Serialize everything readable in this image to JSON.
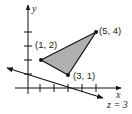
{
  "diagram": {
    "axes": {
      "x_label": "x",
      "y_label": "y",
      "x_ticks": [
        1,
        2,
        3,
        4,
        5
      ],
      "y_ticks": [
        1,
        2,
        3,
        4
      ]
    },
    "triangle": {
      "fill": "#b0b0b0",
      "stroke": "#111111",
      "vertices": [
        {
          "label": "(1, 2)",
          "x": 1,
          "y": 2
        },
        {
          "label": "(5, 4)",
          "x": 5,
          "y": 4
        },
        {
          "label": "(3, 1)",
          "x": 3,
          "y": 1
        }
      ]
    },
    "line": {
      "label": "z = 3"
    }
  }
}
